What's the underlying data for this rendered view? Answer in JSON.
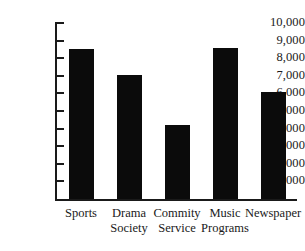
{
  "chart_data": {
    "type": "bar",
    "title": "",
    "subtitle": "",
    "xlabel": "",
    "ylabel": "",
    "categories": [
      "Sports",
      "Drama Society",
      "Commity Service",
      "Music Programs",
      "Newspaper"
    ],
    "category_lines": [
      [
        "Sports"
      ],
      [
        "Drama",
        "Society"
      ],
      [
        "Commity",
        "Service"
      ],
      [
        "Music",
        "Programs"
      ],
      [
        "Newspaper"
      ]
    ],
    "values": [
      8500,
      7050,
      4200,
      8600,
      6100
    ],
    "ylim": [
      0,
      10000
    ],
    "ytick_values": [
      1000,
      2000,
      3000,
      4000,
      5000,
      6000,
      7000,
      8000,
      9000,
      10000
    ],
    "ytick_labels": [
      "1,000",
      "2,000",
      "3,000",
      "4,000",
      "5,000",
      "6,000",
      "7,000",
      "8,000",
      "9,000",
      "10,000"
    ],
    "grid": false,
    "legend": false,
    "legend_position": "none",
    "bar_color": "#0b0b0b",
    "axis_color": "#1a1a1a",
    "background_color": "#ffffff"
  }
}
